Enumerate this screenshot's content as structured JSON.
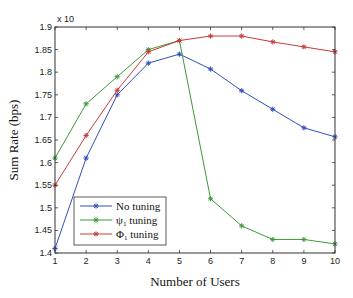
{
  "chart_data": {
    "type": "line",
    "title": "",
    "xlabel": "Number of Users",
    "ylabel": "Sum Rate (bps)",
    "y_multiplier_label": "x 10",
    "x": [
      1,
      2,
      3,
      4,
      5,
      6,
      7,
      8,
      9,
      10
    ],
    "xlim": [
      1,
      10
    ],
    "ylim": [
      1.4,
      1.9
    ],
    "xticks": [
      "1",
      "2",
      "3",
      "4",
      "5",
      "6",
      "7",
      "8",
      "9",
      "10"
    ],
    "yticks": [
      "1.4",
      "1.45",
      "1.5",
      "1.55",
      "1.6",
      "1.65",
      "1.7",
      "1.75",
      "1.8",
      "1.85",
      "1.9"
    ],
    "grid": false,
    "legend_position": "lower left",
    "series": [
      {
        "name": "No tuning",
        "color": "#2f4fbf",
        "marker": "*",
        "values": [
          1.41,
          1.61,
          1.75,
          1.82,
          1.84,
          1.807,
          1.759,
          1.718,
          1.677,
          1.657
        ]
      },
      {
        "name": "ψ1 tuning",
        "color": "#3a9a3a",
        "marker": "*",
        "values": [
          1.61,
          1.73,
          1.79,
          1.85,
          1.87,
          1.52,
          1.46,
          1.43,
          1.43,
          1.42
        ]
      },
      {
        "name": "Φ1 tuning",
        "color": "#c83a3a",
        "marker": "*",
        "values": [
          1.55,
          1.66,
          1.76,
          1.845,
          1.87,
          1.88,
          1.88,
          1.867,
          1.856,
          1.845
        ]
      }
    ]
  },
  "legend": {
    "items": [
      {
        "label": "No tuning"
      },
      {
        "label": "ψ",
        "sub": "1",
        "suffix": " tuning"
      },
      {
        "label": "Φ",
        "sub": "1",
        "suffix": " tuning"
      }
    ]
  }
}
